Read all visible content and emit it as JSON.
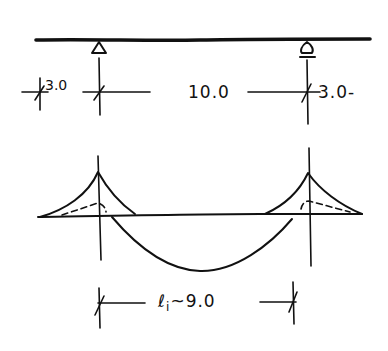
{
  "diagram": {
    "type": "hand-drawn structural sketch",
    "colors": {
      "ink": "#111111",
      "background": "#ffffff"
    },
    "top_beam": {
      "supports": [
        {
          "id": "left-support",
          "type": "pin",
          "x": 99
        },
        {
          "id": "right-support",
          "type": "roller",
          "x": 307
        }
      ]
    },
    "dimensions_top": {
      "left_cantilever": "3.0",
      "span": "10.0",
      "right_cantilever": "3.0-"
    },
    "moment_diagram": {
      "hogging_peaks": [
        "left-support",
        "right-support"
      ],
      "sagging_span": true,
      "dashed_inner_lines": true
    },
    "dimension_bottom": {
      "symbol": "ℓ",
      "subscript": "i",
      "approx": "~",
      "value": "9.0"
    }
  }
}
